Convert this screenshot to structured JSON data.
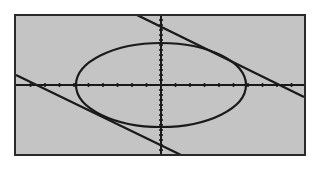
{
  "calculator_screen": {
    "description": "Graphing calculator display: ellipse with two parallel tangent lines",
    "colors": {
      "page_background": "#ffffff",
      "screen_background": "#c4c4c4",
      "ink": "#1a1a1a",
      "frame": "#2a2a2a"
    },
    "frame": {
      "x": 15,
      "y": 15,
      "width": 290,
      "height": 140,
      "stroke_width": 2
    },
    "axes": {
      "origin_px": {
        "x": 161,
        "y": 85
      },
      "x_tick_spacing_px": 14.5,
      "y_tick_spacing_px": 5,
      "tick_length_px": 2
    },
    "ellipse": {
      "cx": 161,
      "cy": 85,
      "rx": 85,
      "ry": 42
    },
    "lines": [
      {
        "name": "upper-tangent-line",
        "x1": 137,
        "y1": 15,
        "x2": 304,
        "y2": 97
      },
      {
        "name": "lower-tangent-line",
        "x1": 16,
        "y1": 75,
        "x2": 181,
        "y2": 155
      }
    ]
  }
}
